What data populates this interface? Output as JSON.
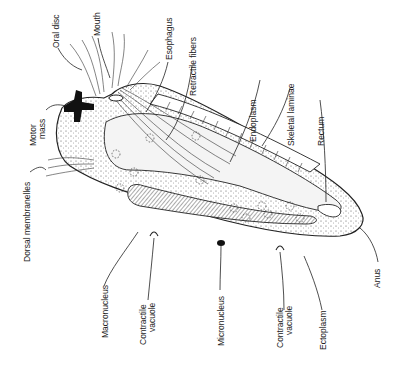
{
  "figure": {
    "orientation": "labels rotated 90 degrees, reading bottom-to-top"
  },
  "labels": {
    "oral_disc": "Oral disc",
    "mouth": "Mouth",
    "esophagus": "Esophagus",
    "retractile_fibers": "Retractile fibers",
    "endoplasm": "Endoplasm",
    "skeletal_laminae": "Skeletal laminae",
    "rectum": "Rectum",
    "motor_mass_1": "Motor",
    "motor_mass_2": "mass",
    "dorsal_membranelles": "Dorsal membranelles",
    "macronucleus": "Macronucleus",
    "contractile_vacuole_a_1": "Contractile",
    "contractile_vacuole_a_2": "vacuole",
    "micronucleus": "Micronucleus",
    "contractile_vacuole_b_1": "Contractile",
    "contractile_vacuole_b_2": "vacuole",
    "ectoplasm": "Ectoplasm",
    "anus": "Anus"
  },
  "colors": {
    "line": "#222222",
    "stipple": "#555555",
    "endoplasm_fill": "#f4f4f4",
    "motor_mass": "#111111",
    "background": "#ffffff"
  }
}
